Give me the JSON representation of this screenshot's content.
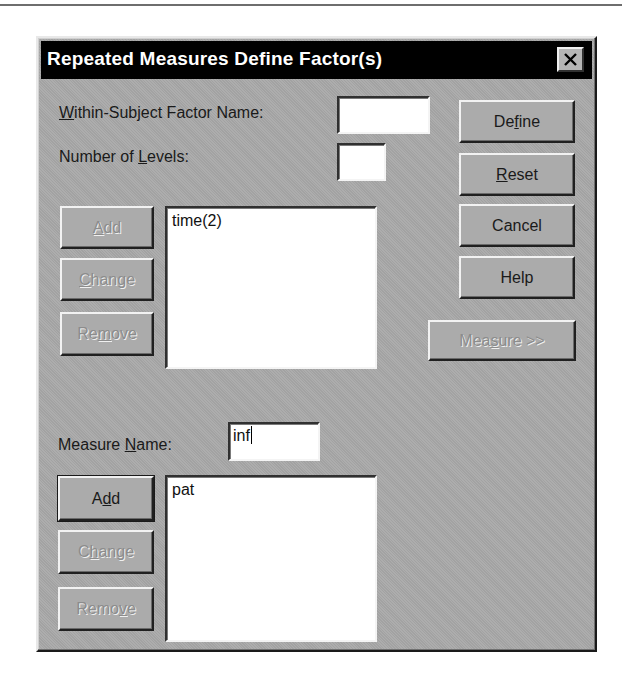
{
  "dialog": {
    "title": "Repeated Measures Define Factor(s)",
    "close_icon": "close-x-icon"
  },
  "factor": {
    "name_label_pre": "",
    "name_label_mnemonic": "W",
    "name_label_post": "ithin-Subject Factor Name:",
    "name_value": "",
    "levels_label_pre": "Number of ",
    "levels_label_mnemonic": "L",
    "levels_label_post": "evels:",
    "levels_value": "",
    "buttons": {
      "add": {
        "pre": "",
        "mn": "A",
        "post": "dd",
        "enabled": false
      },
      "change": {
        "pre": "",
        "mn": "C",
        "post": "hange",
        "enabled": false
      },
      "remove": {
        "pre": "Re",
        "mn": "m",
        "post": "ove",
        "enabled": false
      }
    },
    "list": [
      "time(2)"
    ]
  },
  "side_buttons": {
    "define": {
      "pre": "De",
      "mn": "f",
      "post": "ine",
      "enabled": true
    },
    "reset": {
      "pre": "",
      "mn": "R",
      "post": "eset",
      "enabled": true
    },
    "cancel": {
      "label": "Cancel",
      "enabled": true
    },
    "help": {
      "label": "Help",
      "enabled": true
    },
    "measure": {
      "pre": "Mea",
      "mn": "s",
      "post": "ure >>",
      "enabled": false
    }
  },
  "measure": {
    "name_label_pre": "Measure ",
    "name_label_mnemonic": "N",
    "name_label_post": "ame:",
    "name_value": "inf",
    "buttons": {
      "add": {
        "pre": "A",
        "mn": "d",
        "post": "d",
        "enabled": true
      },
      "change": {
        "pre": "C",
        "mn": "h",
        "post": "ange",
        "enabled": false
      },
      "remove": {
        "pre": "Remo",
        "mn": "v",
        "post": "e",
        "enabled": false
      }
    },
    "list": [
      "pat"
    ]
  }
}
